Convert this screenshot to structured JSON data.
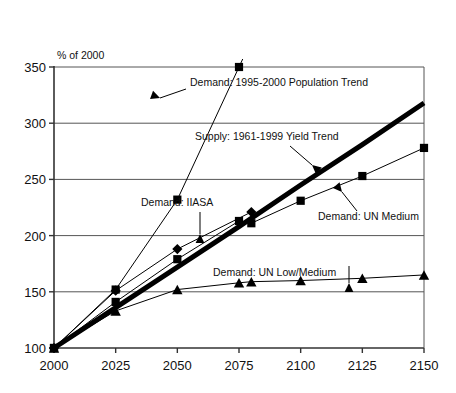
{
  "chart_data": {
    "type": "line",
    "title": "",
    "subtitle": "",
    "xlabel": "",
    "ylabel": "% of 2000",
    "xlim": [
      2000,
      2150
    ],
    "ylim": [
      100,
      350
    ],
    "grid": true,
    "grid_axis": "y",
    "legend_position": "none (inline annotations with leader arrows)",
    "x_ticks": [
      2000,
      2025,
      2050,
      2075,
      2100,
      2125,
      2150
    ],
    "x_tick_labels": [
      "2000",
      "2025",
      "2050",
      "2075",
      "2100",
      "2125",
      "2150"
    ],
    "y_ticks": [
      100,
      150,
      200,
      250,
      300,
      350
    ],
    "y_tick_labels": [
      "100",
      "150",
      "200",
      "250",
      "300",
      "350"
    ],
    "series": [
      {
        "name": "Demand: 1995-2000 Population Trend",
        "marker": "square",
        "line_width": 1,
        "color": "#000000",
        "x": [
          2000,
          2025,
          2050,
          2075
        ],
        "values": [
          100,
          152,
          232,
          350
        ],
        "note": "continues off the top of the plot above 350"
      },
      {
        "name": "Supply: 1961-1999 Yield Trend",
        "marker": "none",
        "line_width": 5,
        "color": "#000000",
        "x": [
          2000,
          2025,
          2050,
          2075,
          2100,
          2125,
          2150
        ],
        "values": [
          100,
          136,
          172,
          208,
          245,
          281,
          318
        ]
      },
      {
        "name": "Demand: IIASA",
        "marker": "diamond",
        "line_width": 1,
        "color": "#000000",
        "x": [
          2000,
          2025,
          2050,
          2080
        ],
        "values": [
          100,
          151,
          188,
          221
        ]
      },
      {
        "name": "Demand: UN Medium",
        "marker": "square",
        "line_width": 1,
        "color": "#000000",
        "x": [
          2000,
          2025,
          2050,
          2075,
          2080,
          2100,
          2125,
          2150
        ],
        "values": [
          100,
          141,
          179,
          213,
          211,
          231,
          253,
          278
        ]
      },
      {
        "name": "Demand: UN Low/Medium",
        "marker": "triangle",
        "line_width": 1,
        "color": "#000000",
        "x": [
          2000,
          2025,
          2050,
          2075,
          2080,
          2100,
          2125,
          2150
        ],
        "values": [
          100,
          133,
          152,
          158,
          159,
          160,
          162,
          165
        ]
      }
    ],
    "annotations": [
      {
        "id": "population-trend",
        "text": "Demand: 1995-2000 Population Trend",
        "points_to_series": "Demand: 1995-2000 Population Trend"
      },
      {
        "id": "yield-trend",
        "text": "Supply: 1961-1999 Yield Trend",
        "points_to_series": "Supply: 1961-1999 Yield Trend"
      },
      {
        "id": "iiasa",
        "text": "Demand: IIASA",
        "points_to_series": "Demand: IIASA"
      },
      {
        "id": "un-medium",
        "text": "Demand: UN Medium",
        "points_to_series": "Demand: UN Medium"
      },
      {
        "id": "un-low-medium",
        "text": "Demand: UN Low/Medium",
        "points_to_series": "Demand: UN Low/Medium"
      }
    ],
    "colors": {
      "ink": "#000000",
      "grid": "#555555",
      "axis": "#333333",
      "background": "#ffffff"
    }
  }
}
